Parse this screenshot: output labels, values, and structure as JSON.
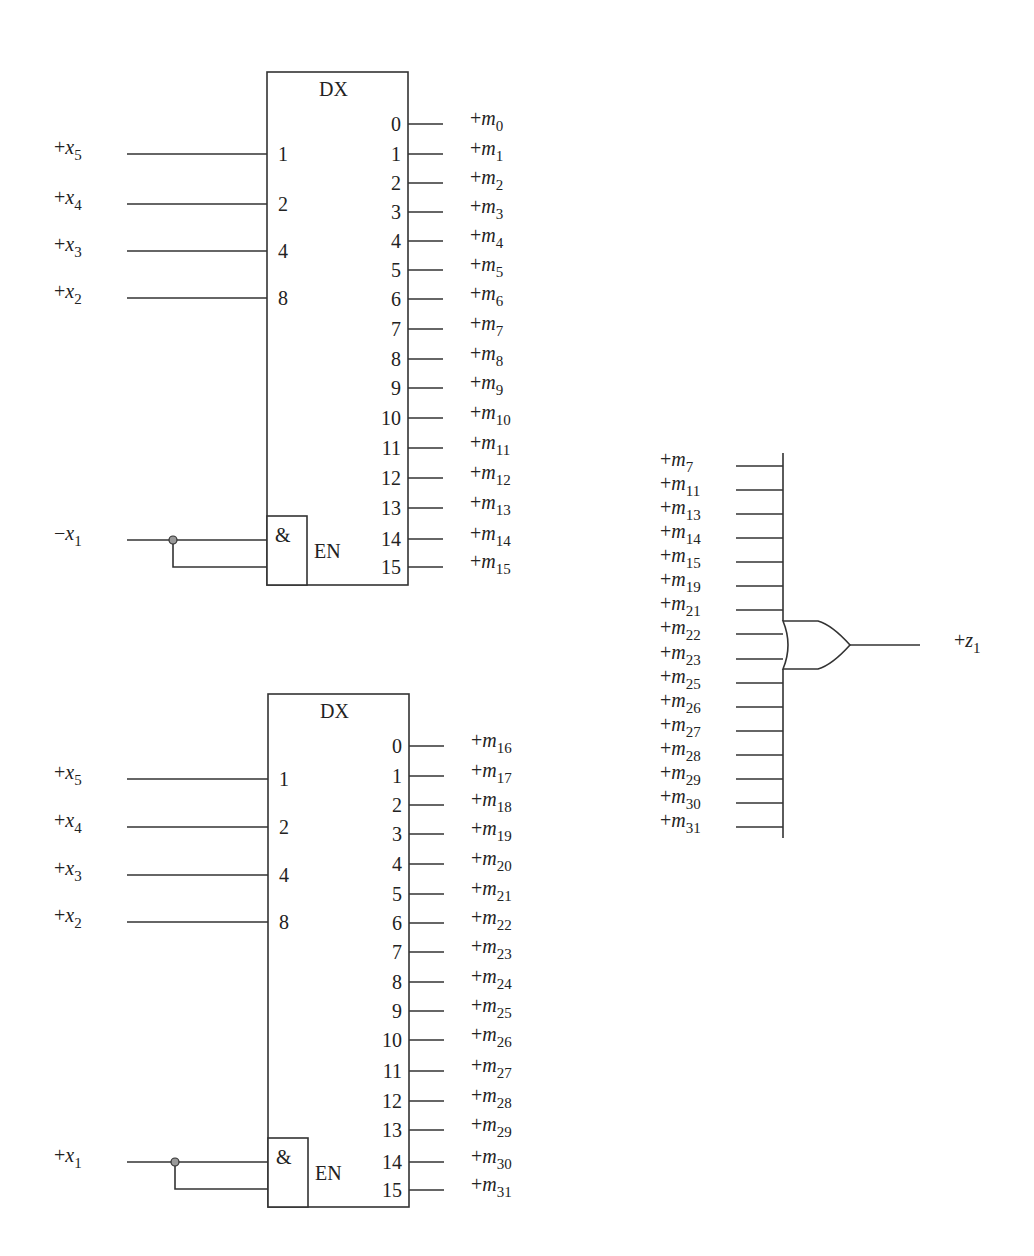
{
  "colors": {
    "line": "#333333",
    "text": "#222222",
    "junction_dot": "#999999",
    "background": "#ffffff"
  },
  "decoders": [
    {
      "id": "dx-top",
      "title": "DX",
      "box": {
        "x": 267,
        "y": 72,
        "w": 141,
        "h": 513
      },
      "inputs": [
        {
          "pin": "1",
          "signal": {
            "sign": "+",
            "var": "x",
            "sub": "5"
          },
          "y": 154
        },
        {
          "pin": "2",
          "signal": {
            "sign": "+",
            "var": "x",
            "sub": "4"
          },
          "y": 204
        },
        {
          "pin": "4",
          "signal": {
            "sign": "+",
            "var": "x",
            "sub": "3"
          },
          "y": 251
        },
        {
          "pin": "8",
          "signal": {
            "sign": "+",
            "var": "x",
            "sub": "2"
          },
          "y": 298
        }
      ],
      "enable": {
        "gate_symbol": "&",
        "label": "EN",
        "signal": {
          "sign": "−",
          "var": "x",
          "sub": "1"
        },
        "gate_box": {
          "x": 267,
          "y": 516,
          "w": 40,
          "h": 69
        },
        "y1": 540,
        "y2": 567,
        "dot_x": 173
      },
      "outputs": [
        {
          "pin": "0",
          "signal": {
            "sign": "+",
            "var": "m",
            "sub": "0"
          },
          "y": 124
        },
        {
          "pin": "1",
          "signal": {
            "sign": "+",
            "var": "m",
            "sub": "1"
          },
          "y": 154
        },
        {
          "pin": "2",
          "signal": {
            "sign": "+",
            "var": "m",
            "sub": "2"
          },
          "y": 183
        },
        {
          "pin": "3",
          "signal": {
            "sign": "+",
            "var": "m",
            "sub": "3"
          },
          "y": 212
        },
        {
          "pin": "4",
          "signal": {
            "sign": "+",
            "var": "m",
            "sub": "4"
          },
          "y": 241
        },
        {
          "pin": "5",
          "signal": {
            "sign": "+",
            "var": "m",
            "sub": "5"
          },
          "y": 270
        },
        {
          "pin": "6",
          "signal": {
            "sign": "+",
            "var": "m",
            "sub": "6"
          },
          "y": 299
        },
        {
          "pin": "7",
          "signal": {
            "sign": "+",
            "var": "m",
            "sub": "7"
          },
          "y": 329
        },
        {
          "pin": "8",
          "signal": {
            "sign": "+",
            "var": "m",
            "sub": "8"
          },
          "y": 359
        },
        {
          "pin": "9",
          "signal": {
            "sign": "+",
            "var": "m",
            "sub": "9"
          },
          "y": 388
        },
        {
          "pin": "10",
          "signal": {
            "sign": "+",
            "var": "m",
            "sub": "10"
          },
          "y": 418
        },
        {
          "pin": "11",
          "signal": {
            "sign": "+",
            "var": "m",
            "sub": "11"
          },
          "y": 448
        },
        {
          "pin": "12",
          "signal": {
            "sign": "+",
            "var": "m",
            "sub": "12"
          },
          "y": 478
        },
        {
          "pin": "13",
          "signal": {
            "sign": "+",
            "var": "m",
            "sub": "13"
          },
          "y": 508
        },
        {
          "pin": "14",
          "signal": {
            "sign": "+",
            "var": "m",
            "sub": "14"
          },
          "y": 539
        },
        {
          "pin": "15",
          "signal": {
            "sign": "+",
            "var": "m",
            "sub": "15"
          },
          "y": 567
        }
      ]
    },
    {
      "id": "dx-bottom",
      "title": "DX",
      "box": {
        "x": 268,
        "y": 694,
        "w": 141,
        "h": 513
      },
      "inputs": [
        {
          "pin": "1",
          "signal": {
            "sign": "+",
            "var": "x",
            "sub": "5"
          },
          "y": 779
        },
        {
          "pin": "2",
          "signal": {
            "sign": "+",
            "var": "x",
            "sub": "4"
          },
          "y": 827
        },
        {
          "pin": "4",
          "signal": {
            "sign": "+",
            "var": "x",
            "sub": "3"
          },
          "y": 875
        },
        {
          "pin": "8",
          "signal": {
            "sign": "+",
            "var": "x",
            "sub": "2"
          },
          "y": 922
        }
      ],
      "enable": {
        "gate_symbol": "&",
        "label": "EN",
        "signal": {
          "sign": "+",
          "var": "x",
          "sub": "1"
        },
        "gate_box": {
          "x": 268,
          "y": 1138,
          "w": 40,
          "h": 69
        },
        "y1": 1162,
        "y2": 1189,
        "dot_x": 175
      },
      "outputs": [
        {
          "pin": "0",
          "signal": {
            "sign": "+",
            "var": "m",
            "sub": "16"
          },
          "y": 746
        },
        {
          "pin": "1",
          "signal": {
            "sign": "+",
            "var": "m",
            "sub": "17"
          },
          "y": 776
        },
        {
          "pin": "2",
          "signal": {
            "sign": "+",
            "var": "m",
            "sub": "18"
          },
          "y": 805
        },
        {
          "pin": "3",
          "signal": {
            "sign": "+",
            "var": "m",
            "sub": "19"
          },
          "y": 834
        },
        {
          "pin": "4",
          "signal": {
            "sign": "+",
            "var": "m",
            "sub": "20"
          },
          "y": 864
        },
        {
          "pin": "5",
          "signal": {
            "sign": "+",
            "var": "m",
            "sub": "21"
          },
          "y": 894
        },
        {
          "pin": "6",
          "signal": {
            "sign": "+",
            "var": "m",
            "sub": "22"
          },
          "y": 923
        },
        {
          "pin": "7",
          "signal": {
            "sign": "+",
            "var": "m",
            "sub": "23"
          },
          "y": 952
        },
        {
          "pin": "8",
          "signal": {
            "sign": "+",
            "var": "m",
            "sub": "24"
          },
          "y": 982
        },
        {
          "pin": "9",
          "signal": {
            "sign": "+",
            "var": "m",
            "sub": "25"
          },
          "y": 1011
        },
        {
          "pin": "10",
          "signal": {
            "sign": "+",
            "var": "m",
            "sub": "26"
          },
          "y": 1040
        },
        {
          "pin": "11",
          "signal": {
            "sign": "+",
            "var": "m",
            "sub": "27"
          },
          "y": 1071
        },
        {
          "pin": "12",
          "signal": {
            "sign": "+",
            "var": "m",
            "sub": "28"
          },
          "y": 1101
        },
        {
          "pin": "13",
          "signal": {
            "sign": "+",
            "var": "m",
            "sub": "29"
          },
          "y": 1130
        },
        {
          "pin": "14",
          "signal": {
            "sign": "+",
            "var": "m",
            "sub": "30"
          },
          "y": 1162
        },
        {
          "pin": "15",
          "signal": {
            "sign": "+",
            "var": "m",
            "sub": "31"
          },
          "y": 1190
        }
      ]
    }
  ],
  "or_gate": {
    "bus_x": 783,
    "bus_top": 453,
    "bus_bottom": 838,
    "gate_top": 621,
    "gate_bottom": 669,
    "gate_tip_x": 850,
    "output_end_x": 920,
    "output_y": 645,
    "output_signal": {
      "sign": "+",
      "var": "z",
      "sub": "1"
    },
    "inputs": [
      {
        "signal": {
          "sign": "+",
          "var": "m",
          "sub": "7"
        },
        "y": 466
      },
      {
        "signal": {
          "sign": "+",
          "var": "m",
          "sub": "11"
        },
        "y": 490
      },
      {
        "signal": {
          "sign": "+",
          "var": "m",
          "sub": "13"
        },
        "y": 514
      },
      {
        "signal": {
          "sign": "+",
          "var": "m",
          "sub": "14"
        },
        "y": 538
      },
      {
        "signal": {
          "sign": "+",
          "var": "m",
          "sub": "15"
        },
        "y": 562
      },
      {
        "signal": {
          "sign": "+",
          "var": "m",
          "sub": "19"
        },
        "y": 586
      },
      {
        "signal": {
          "sign": "+",
          "var": "m",
          "sub": "21"
        },
        "y": 610
      },
      {
        "signal": {
          "sign": "+",
          "var": "m",
          "sub": "22"
        },
        "y": 634
      },
      {
        "signal": {
          "sign": "+",
          "var": "m",
          "sub": "23"
        },
        "y": 659
      },
      {
        "signal": {
          "sign": "+",
          "var": "m",
          "sub": "25"
        },
        "y": 683
      },
      {
        "signal": {
          "sign": "+",
          "var": "m",
          "sub": "26"
        },
        "y": 707
      },
      {
        "signal": {
          "sign": "+",
          "var": "m",
          "sub": "27"
        },
        "y": 731
      },
      {
        "signal": {
          "sign": "+",
          "var": "m",
          "sub": "28"
        },
        "y": 755
      },
      {
        "signal": {
          "sign": "+",
          "var": "m",
          "sub": "29"
        },
        "y": 779
      },
      {
        "signal": {
          "sign": "+",
          "var": "m",
          "sub": "30"
        },
        "y": 803
      },
      {
        "signal": {
          "sign": "+",
          "var": "m",
          "sub": "31"
        },
        "y": 827
      }
    ]
  }
}
